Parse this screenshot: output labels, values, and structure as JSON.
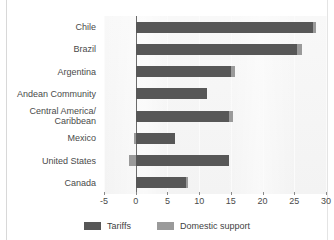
{
  "figure": {
    "clipped_title": "",
    "frame_color": "#d8d8d8",
    "panel_background": "#f4f4f4"
  },
  "legend": {
    "items": [
      {
        "label": "Tariffs",
        "color": "#575757",
        "swatch_name": "legend-swatch-tariffs"
      },
      {
        "label": "Domestic support",
        "color": "#9a9a9a",
        "swatch_name": "legend-swatch-domestic-support"
      }
    ]
  },
  "axis": {
    "ticks": [
      "-5",
      "0",
      "5",
      "10",
      "15",
      "20",
      "25",
      "30"
    ]
  },
  "chart_data": {
    "type": "bar",
    "orientation": "horizontal",
    "stacked": true,
    "title": "",
    "xlabel": "",
    "ylabel": "",
    "xlim": [
      -5,
      30
    ],
    "xticks": [
      -5,
      0,
      5,
      10,
      15,
      20,
      25,
      30
    ],
    "grid": true,
    "legend_position": "bottom",
    "categories": [
      "Chile",
      "Brazil",
      "Argentina",
      "Andean Community",
      "Central America/\nCaribbean",
      "Mexico",
      "United States",
      "Canada"
    ],
    "series": [
      {
        "name": "Tariffs",
        "color": "#575757",
        "values": [
          28.0,
          25.5,
          15.0,
          11.3,
          14.7,
          6.2,
          14.7,
          8.0
        ]
      },
      {
        "name": "Domestic support",
        "color": "#9a9a9a",
        "values": [
          0.4,
          0.7,
          0.6,
          0.0,
          0.6,
          -0.3,
          -1.1,
          0.3
        ]
      }
    ],
    "totals": [
      28.4,
      26.2,
      15.6,
      11.3,
      15.3,
      5.9,
      13.6,
      8.3
    ]
  }
}
